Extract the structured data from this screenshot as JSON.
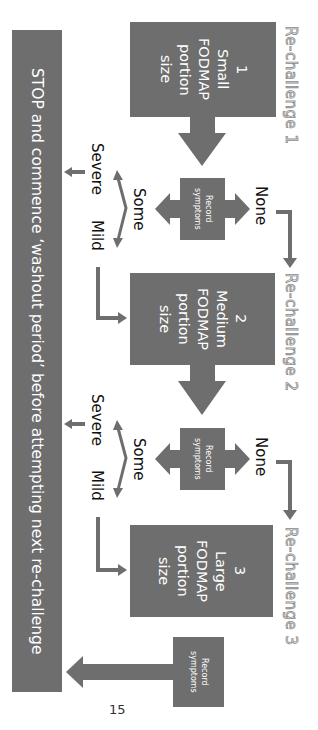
{
  "orientation": "rotated 90 degrees clockwise",
  "colors": {
    "box": "#6e6e6e",
    "arrow": "#6e6e6e",
    "text_on_box": "#ffffff",
    "label": "#111111",
    "rechallenge_outline": "#8a8a8a"
  },
  "stop_bar": {
    "text": "STOP and commence ‘washout period’ before attempting next re-challenge"
  },
  "rechallenges": [
    {
      "title": "Re-challenge 1",
      "step": "1",
      "size": "Small",
      "lines": [
        "1",
        "Small",
        "FODMAP",
        "portion",
        "size"
      ]
    },
    {
      "title": "Re-challenge 2",
      "step": "2",
      "size": "Medium",
      "lines": [
        "2",
        "Medium",
        "FODMAP",
        "portion",
        "size"
      ]
    },
    {
      "title": "Re-challenge 3",
      "step": "3",
      "size": "Large",
      "lines": [
        "3",
        "Large",
        "FODMAP",
        "portion",
        "size"
      ]
    }
  ],
  "record": {
    "line1": "Record",
    "line2": "symptoms"
  },
  "outcomes": {
    "none": "None",
    "some": "Some",
    "severe": "Severe",
    "mild": "Mild"
  },
  "page_number": "15"
}
